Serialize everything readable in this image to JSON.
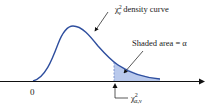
{
  "figure": {
    "curve_label": {
      "symbol": "χ",
      "sup": "2",
      "sub": "ν",
      "text": " density curve"
    },
    "shaded_label": "Shaded area = α",
    "origin_label": "0",
    "critical_label": {
      "symbol": "χ",
      "sup": "2",
      "sub": "α,ν"
    },
    "colors": {
      "curve": "#2e4e9e",
      "shade": "#b9c9ec",
      "axis": "#111111",
      "text": "#1a1a1a"
    }
  }
}
